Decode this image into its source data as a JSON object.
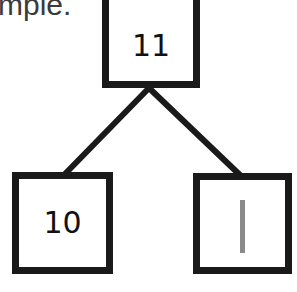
{
  "caption": {
    "text": "mple."
  },
  "tree": {
    "root": {
      "label": "11"
    },
    "children": [
      {
        "label": "10",
        "kind": "number"
      },
      {
        "label": "",
        "kind": "tally-mark",
        "mark_color": "#8a8a8a",
        "represents": "1"
      }
    ]
  },
  "colors": {
    "border": "#1a1a1a",
    "text": "#111111",
    "caption": "#3a3a3a",
    "background": "#ffffff"
  }
}
